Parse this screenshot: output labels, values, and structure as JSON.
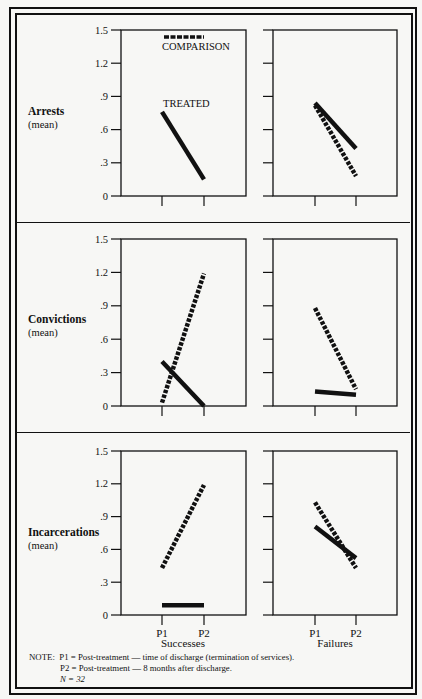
{
  "chart_data": [
    {
      "type": "line",
      "title": "Arrests (mean) — Successes",
      "row": "Arrests",
      "column": "Successes",
      "x": [
        "P1",
        "P2"
      ],
      "series": [
        {
          "name": "TREATED",
          "style": "solid",
          "values": [
            0.76,
            0.15
          ]
        },
        {
          "name": "COMPARISON",
          "style": "dashed",
          "values": [
            null,
            null
          ]
        }
      ],
      "ylabel": "Arrests (mean)",
      "ylim": [
        0,
        1.5
      ],
      "yticks": [
        0,
        0.3,
        0.6,
        0.9,
        1.2,
        1.5
      ],
      "legend": "inside, series labels 'COMPARISON' (top) and 'TREATED' placed in panel"
    },
    {
      "type": "line",
      "title": "Arrests (mean) — Failures",
      "row": "Arrests",
      "column": "Failures",
      "x": [
        "P1",
        "P2"
      ],
      "series": [
        {
          "name": "TREATED",
          "style": "solid",
          "values": [
            0.84,
            0.43
          ]
        },
        {
          "name": "COMPARISON",
          "style": "dashed",
          "values": [
            0.82,
            0.18
          ]
        }
      ],
      "ylim": [
        0,
        1.5
      ]
    },
    {
      "type": "line",
      "title": "Convictions (mean) — Successes",
      "row": "Convictions",
      "column": "Successes",
      "x": [
        "P1",
        "P2"
      ],
      "series": [
        {
          "name": "TREATED",
          "style": "solid",
          "values": [
            0.4,
            0.0
          ]
        },
        {
          "name": "COMPARISON",
          "style": "dashed",
          "values": [
            0.03,
            1.19
          ]
        }
      ],
      "ylabel": "Convictions (mean)",
      "ylim": [
        0,
        1.5
      ],
      "yticks": [
        0,
        0.3,
        0.6,
        0.9,
        1.2,
        1.5
      ]
    },
    {
      "type": "line",
      "title": "Convictions (mean) — Failures",
      "row": "Convictions",
      "column": "Failures",
      "x": [
        "P1",
        "P2"
      ],
      "series": [
        {
          "name": "TREATED",
          "style": "solid",
          "values": [
            0.13,
            0.1
          ]
        },
        {
          "name": "COMPARISON",
          "style": "dashed",
          "values": [
            0.88,
            0.15
          ]
        }
      ],
      "ylim": [
        0,
        1.5
      ]
    },
    {
      "type": "line",
      "title": "Incarcerations (mean) — Successes",
      "row": "Incarcerations",
      "column": "Successes",
      "x": [
        "P1",
        "P2"
      ],
      "series": [
        {
          "name": "TREATED",
          "style": "solid",
          "values": [
            0.09,
            0.09
          ]
        },
        {
          "name": "COMPARISON",
          "style": "dashed",
          "values": [
            0.43,
            1.19
          ]
        }
      ],
      "ylabel": "Incarcerations (mean)",
      "ylim": [
        0,
        1.5
      ],
      "yticks": [
        0,
        0.3,
        0.6,
        0.9,
        1.2,
        1.5
      ],
      "xlabel": "Successes"
    },
    {
      "type": "line",
      "title": "Incarcerations (mean) — Failures",
      "row": "Incarcerations",
      "column": "Failures",
      "x": [
        "P1",
        "P2"
      ],
      "series": [
        {
          "name": "TREATED",
          "style": "solid",
          "values": [
            0.81,
            0.52
          ]
        },
        {
          "name": "COMPARISON",
          "style": "dashed",
          "values": [
            1.03,
            0.43
          ]
        }
      ],
      "ylim": [
        0,
        1.5
      ],
      "xlabel": "Failures"
    }
  ],
  "rows": [
    {
      "label": "Arrests",
      "sublabel": "(mean)"
    },
    {
      "label": "Convictions",
      "sublabel": "(mean)"
    },
    {
      "label": "Incarcerations",
      "sublabel": "(mean)"
    }
  ],
  "columns": [
    {
      "label": "Successes"
    },
    {
      "label": "Failures"
    }
  ],
  "y_tick_labels": [
    "0",
    ".3",
    ".6",
    ".9",
    "1.2",
    "1.5"
  ],
  "x_tick_labels": [
    "P1",
    "P2"
  ],
  "legend": {
    "comparison": "COMPARISON",
    "treated": "TREATED"
  },
  "note": {
    "line1": "NOTE:  P1 = Post-treatment — time of discharge (termination of services).",
    "line2": "P2 = Post-treatment — 8 months after discharge.",
    "line3": "N = 32"
  },
  "colors": {
    "ink": "#111111",
    "paper": "#f7f7f5"
  }
}
